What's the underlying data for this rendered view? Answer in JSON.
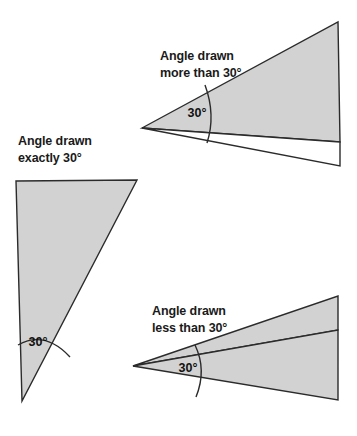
{
  "figure": {
    "title_text_present": false,
    "background_color": "#ffffff",
    "fill_color": "#d2d2d2",
    "stroke_color": "#2b2b2b",
    "text_color": "#1a1a1a",
    "stroke_width": 1.4,
    "panels": [
      {
        "id": "more-than-30",
        "caption_line1": "Angle drawn",
        "caption_line2": "more than 30°",
        "caption_x": 160,
        "caption_y1": 60,
        "caption_y2": 77,
        "angle_label": "30°",
        "angle_label_x": 197,
        "angle_label_y": 117,
        "shaded_polygon": "142,128 338,22 340,142",
        "outline_polygon": "142,128 340,142 340,166",
        "arc_path": "M 205,85 Q 216,115 207,143",
        "arc_width": 1.4
      },
      {
        "id": "exactly-30",
        "caption_line1": "Angle drawn",
        "caption_line2": "exactly 30°",
        "caption_x": 18,
        "caption_y1": 145,
        "caption_y2": 162,
        "angle_label": "30°",
        "angle_label_x": 38,
        "angle_label_y": 346,
        "shaded_polygon": "16,181 137,180 22,401",
        "outline_polygon": "",
        "arc_path": "M 18,345 Q 45,330 70,357",
        "arc_width": 1.4
      },
      {
        "id": "less-than-30",
        "caption_line1": "Angle drawn",
        "caption_line2": "less than 30°",
        "caption_x": 152,
        "caption_y1": 315,
        "caption_y2": 332,
        "angle_label": "30°",
        "angle_label_x": 188,
        "angle_label_y": 372,
        "shaded_polygon": "133,366 338,296 338,330",
        "outline_polygon": "133,366 338,330 338,400",
        "arc_path": "M 195,345 Q 207,370 196,397",
        "arc_width": 1.4
      }
    ]
  }
}
